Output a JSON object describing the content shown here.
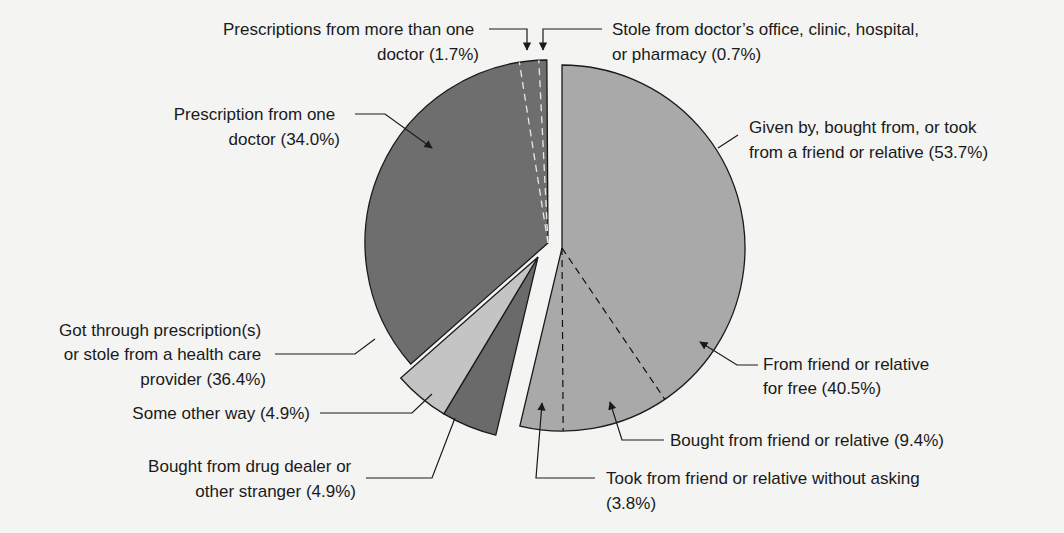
{
  "chart_data": {
    "type": "pie",
    "title": "",
    "start_angle_deg": 0,
    "direction": "clockwise",
    "groups": [
      {
        "name": "Given by, bought from, or took from a friend or relative",
        "value": 53.7,
        "label_lines": [
          "Given by, bought from, or took",
          "from a friend or relative (53.7%)"
        ],
        "color": "#a9a9a9",
        "center": [
          562,
          248
        ],
        "slices": [
          {
            "name": "From friend or relative for free",
            "value": 40.5,
            "label_lines": [
              "From friend or relative",
              "for free (40.5%)"
            ]
          },
          {
            "name": "Bought from friend or relative",
            "value": 9.4,
            "label_lines": [
              "Bought from friend or relative (9.4%)"
            ]
          },
          {
            "name": "Took from friend or relative without asking",
            "value": 3.8,
            "label_lines": [
              "Took from friend or relative without asking",
              "(3.8%)"
            ]
          }
        ]
      },
      {
        "name": "Bought from drug dealer or other stranger",
        "value": 4.9,
        "label_lines": [
          "Bought from drug dealer or",
          "other stranger (4.9%)"
        ],
        "color": "#6a6a6a",
        "center": [
          538,
          257
        ],
        "slices": []
      },
      {
        "name": "Some other way",
        "value": 4.9,
        "label_lines": [
          "Some other way (4.9%)"
        ],
        "color": "#c4c4c4",
        "center": [
          538,
          257
        ],
        "slices": []
      },
      {
        "name": "Got through prescription(s) or stole from a health care provider",
        "value": 36.4,
        "label_lines": [
          "Got through prescription(s)",
          "or stole from a health care",
          "provider (36.4%)"
        ],
        "color": "#6e6e6e",
        "center": [
          548,
          243
        ],
        "slices": [
          {
            "name": "Prescription from one doctor",
            "value": 34.0,
            "label_lines": [
              "Prescription from one",
              "doctor (34.0%)"
            ]
          },
          {
            "name": "Prescriptions from more than one doctor",
            "value": 1.7,
            "label_lines": [
              "Prescriptions from more than one",
              "doctor (1.7%)"
            ]
          },
          {
            "name": "Stole from doctor's office, clinic, hospital, or pharmacy",
            "value": 0.7,
            "label_lines": [
              "Stole from doctor’s office, clinic, hospital,",
              "or pharmacy (0.7%)"
            ]
          }
        ]
      }
    ],
    "values": [
      40.5,
      9.4,
      3.8,
      4.9,
      4.9,
      34.0,
      1.7,
      0.7
    ],
    "categories": [
      "From friend or relative for free",
      "Bought from friend or relative",
      "Took from friend or relative without asking",
      "Bought from drug dealer or other stranger",
      "Some other way",
      "Prescription from one doctor",
      "Prescriptions from more than one doctor",
      "Stole from doctor's office, clinic, hospital, or pharmacy"
    ],
    "legend": "none (callout labels with leader lines)",
    "radius": 183
  },
  "labels": {
    "rx_more": [
      "Prescriptions from more than one",
      "doctor (1.7%)"
    ],
    "stole": [
      "Stole from doctor’s office, clinic, hospital,",
      "or pharmacy (0.7%)"
    ],
    "rx_one": [
      "Prescription from one",
      "doctor (34.0%)"
    ],
    "friend_group": [
      "Given by, bought from, or took",
      "from a friend or relative (53.7%)"
    ],
    "rx_group": [
      "Got through prescription(s)",
      "or stole from a health care",
      "provider (36.4%)"
    ],
    "free": [
      "From friend or relative",
      "for free (40.5%)"
    ],
    "other_way": [
      "Some other way (4.9%)"
    ],
    "bought_friend": [
      "Bought from friend or relative (9.4%)"
    ],
    "dealer": [
      "Bought from drug dealer or",
      "other stranger (4.9%)"
    ],
    "took": [
      "Took from friend or relative without asking",
      "(3.8%)"
    ]
  }
}
